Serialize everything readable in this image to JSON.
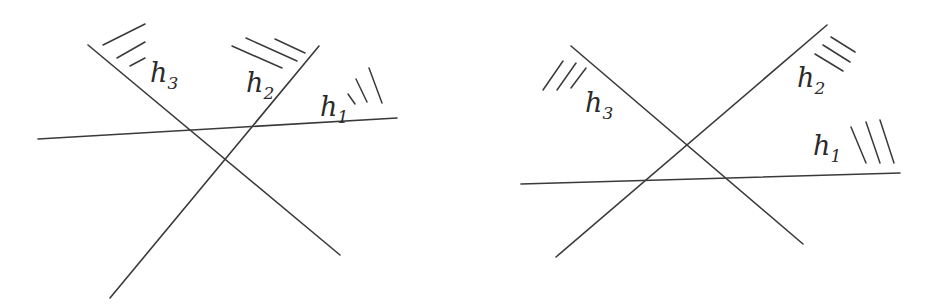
{
  "figure": {
    "background": "#ffffff",
    "line_color": "#3a3a3a",
    "panels": [
      {
        "id": "left",
        "description": "Three half-planes whose boundary lines meet pairwise, forming a small triangle",
        "labels": [
          {
            "id": "h3",
            "base": "h",
            "sub": "3",
            "x": 150,
            "y": 82
          },
          {
            "id": "h2",
            "base": "h",
            "sub": "2",
            "x": 246,
            "y": 92
          },
          {
            "id": "h1",
            "base": "h",
            "sub": "1",
            "x": 320,
            "y": 116
          }
        ],
        "lines": [
          {
            "id": "h3",
            "x1": 88,
            "y1": 45,
            "x2": 340,
            "y2": 255
          },
          {
            "id": "h2",
            "x1": 319,
            "y1": 46,
            "x2": 110,
            "y2": 298
          },
          {
            "id": "h1",
            "x1": 38,
            "y1": 139,
            "x2": 397,
            "y2": 118
          }
        ],
        "hatches": [
          {
            "for": "h3",
            "segments": [
              [
                103,
                45,
                145,
                24
              ],
              [
                117,
                58,
                145,
                42
              ],
              [
                130,
                66,
                145,
                58
              ]
            ]
          },
          {
            "for": "h2",
            "segments": [
              [
                232,
                46,
                282,
                68
              ],
              [
                246,
                38,
                297,
                61
              ],
              [
                275,
                39,
                305,
                53
              ]
            ]
          },
          {
            "for": "h1",
            "segments": [
              [
                348,
                94,
                355,
                104
              ],
              [
                356,
                79,
                367,
                102
              ],
              [
                369,
                68,
                382,
                103
              ]
            ]
          }
        ]
      },
      {
        "id": "right",
        "description": "Three half-planes arranged so the lines form a triangle with half-planes facing outward",
        "labels": [
          {
            "id": "h3",
            "base": "h",
            "sub": "3",
            "x": 585,
            "y": 112
          },
          {
            "id": "h2",
            "base": "h",
            "sub": "2",
            "x": 797,
            "y": 87
          },
          {
            "id": "h1",
            "base": "h",
            "sub": "1",
            "x": 813,
            "y": 155
          }
        ],
        "lines": [
          {
            "id": "h3",
            "x1": 571,
            "y1": 46,
            "x2": 803,
            "y2": 244
          },
          {
            "id": "h2",
            "x1": 827,
            "y1": 25,
            "x2": 556,
            "y2": 257
          },
          {
            "id": "h1",
            "x1": 521,
            "y1": 184,
            "x2": 900,
            "y2": 173
          }
        ],
        "hatches": [
          {
            "for": "h3",
            "segments": [
              [
                543,
                90,
                563,
                61
              ],
              [
                557,
                90,
                576,
                63
              ],
              [
                571,
                88,
                586,
                68
              ]
            ]
          },
          {
            "for": "h2",
            "segments": [
              [
                815,
                54,
                843,
                71
              ],
              [
                823,
                45,
                850,
                62
              ],
              [
                831,
                37,
                855,
                52
              ]
            ]
          },
          {
            "for": "h1",
            "segments": [
              [
                851,
                127,
                866,
                163
              ],
              [
                866,
                122,
                880,
                163
              ],
              [
                880,
                120,
                894,
                163
              ]
            ]
          }
        ]
      }
    ]
  }
}
